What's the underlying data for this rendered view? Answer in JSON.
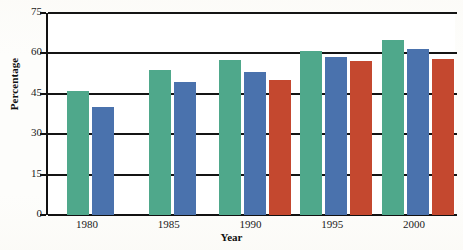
{
  "chart_data": {
    "type": "bar",
    "title": "",
    "xlabel": "Year",
    "ylabel": "Percentage",
    "categories": [
      "1980",
      "1985",
      "1990",
      "1995",
      "2000"
    ],
    "series": [
      {
        "name": "green-series",
        "color": "#4fa88b",
        "values": [
          46,
          54,
          57.5,
          61,
          65
        ]
      },
      {
        "name": "blue-series",
        "color": "#4a72ad",
        "values": [
          40,
          49.5,
          53,
          58.5,
          61.5
        ]
      },
      {
        "name": "red-series",
        "color": "#c4482f",
        "values": [
          null,
          null,
          50,
          57,
          58
        ]
      }
    ],
    "ylim": [
      0,
      75
    ],
    "yticks": [
      0,
      15,
      30,
      45,
      60,
      75
    ],
    "ytick_labels": [
      "0",
      "15",
      "30",
      "45",
      "60",
      "75"
    ],
    "grid": true,
    "legend": "none"
  },
  "axes": {
    "y_title": "Percentage",
    "x_title": "Year",
    "y_ticks": [
      {
        "label": "75",
        "value": 75
      },
      {
        "label": "60",
        "value": 60
      },
      {
        "label": "45",
        "value": 45
      },
      {
        "label": "30",
        "value": 30
      },
      {
        "label": "15",
        "value": 15
      },
      {
        "label": "0",
        "value": 0
      }
    ],
    "x_ticks": [
      {
        "label": "1980"
      },
      {
        "label": "1985"
      },
      {
        "label": "1990"
      },
      {
        "label": "1995"
      },
      {
        "label": "2000"
      }
    ]
  },
  "colors": {
    "green": "#4fa88b",
    "blue": "#4a72ad",
    "red": "#c4482f",
    "axis": "#111111",
    "plot_background": "#ffffff"
  }
}
